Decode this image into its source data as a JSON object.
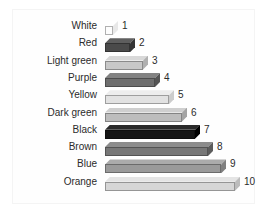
{
  "chart": {
    "background_color": "#ffffff",
    "plot_border_color": "#f4f4f4",
    "label_color": "#2b2b2b"
  },
  "chart_data": {
    "type": "bar",
    "orientation": "horizontal",
    "style": "3d-blocks-grayscale",
    "title": "",
    "subtitle": "",
    "xlabel": "",
    "ylabel": "",
    "xlim": [
      0,
      10
    ],
    "grid": false,
    "legend": null,
    "categories": [
      "White",
      "Red",
      "Light green",
      "Purple",
      "Yellow",
      "Dark green",
      "Black",
      "Brown",
      "Blue",
      "Orange"
    ],
    "values": [
      1,
      2,
      3,
      4,
      5,
      6,
      7,
      8,
      9,
      10
    ],
    "data_labels": [
      "1",
      "2",
      "3",
      "4",
      "5",
      "6",
      "7",
      "8",
      "9",
      "10"
    ],
    "bar_fill_colors": [
      "#fdfdfd",
      "#4a4a4a",
      "#c8c8c8",
      "#6e6e6e",
      "#e2e2e2",
      "#bdbdbd",
      "#151515",
      "#777777",
      "#9a9a9a",
      "#d6d6d6"
    ],
    "bar_top_colors": [
      "#ffffff",
      "#5e5e5e",
      "#d8d8d8",
      "#828282",
      "#ededed",
      "#cfcfcf",
      "#2a2a2a",
      "#8c8c8c",
      "#ababab",
      "#e4e4e4"
    ],
    "bar_side_colors": [
      "#e8e8e8",
      "#343434",
      "#b0b0b0",
      "#545454",
      "#cccccc",
      "#a4a4a4",
      "#000000",
      "#5c5c5c",
      "#7f7f7f",
      "#bcbcbc"
    ],
    "rows": [
      {
        "label": "White",
        "value": 1,
        "data_label": "1",
        "bar_px": 8,
        "fill": "#fdfdfd",
        "top": "#ffffff",
        "side": "#e8e8e8",
        "striped": false
      },
      {
        "label": "Red",
        "value": 2,
        "data_label": "2",
        "bar_px": 25,
        "fill": "#4a4a4a",
        "top": "#5e5e5e",
        "side": "#343434",
        "striped": false
      },
      {
        "label": "Light green",
        "value": 3,
        "data_label": "3",
        "bar_px": 38,
        "fill": "#c8c8c8",
        "top": "#d8d8d8",
        "side": "#b0b0b0",
        "striped": false
      },
      {
        "label": "Purple",
        "value": 4,
        "data_label": "4",
        "bar_px": 50,
        "fill": "#6e6e6e",
        "top": "#828282",
        "side": "#545454",
        "striped": false
      },
      {
        "label": "Yellow",
        "value": 5,
        "data_label": "5",
        "bar_px": 64,
        "fill": "#e2e2e2",
        "top": "#ededed",
        "side": "#cccccc",
        "striped": false
      },
      {
        "label": "Dark green",
        "value": 6,
        "data_label": "6",
        "bar_px": 77,
        "fill": "#bdbdbd",
        "top": "#cfcfcf",
        "side": "#a4a4a4",
        "striped": false
      },
      {
        "label": "Black",
        "value": 7,
        "data_label": "7",
        "bar_px": 90,
        "fill": "#151515",
        "top": "#2a2a2a",
        "side": "#000000",
        "striped": true
      },
      {
        "label": "Brown",
        "value": 8,
        "data_label": "8",
        "bar_px": 103,
        "fill": "#777777",
        "top": "#8c8c8c",
        "side": "#5c5c5c",
        "striped": false
      },
      {
        "label": "Blue",
        "value": 9,
        "data_label": "9",
        "bar_px": 116,
        "fill": "#9a9a9a",
        "top": "#ababab",
        "side": "#7f7f7f",
        "striped": false
      },
      {
        "label": "Orange",
        "value": 10,
        "data_label": "10",
        "bar_px": 130,
        "fill": "#d6d6d6",
        "top": "#e4e4e4",
        "side": "#bcbcbc",
        "striped": false
      }
    ]
  }
}
